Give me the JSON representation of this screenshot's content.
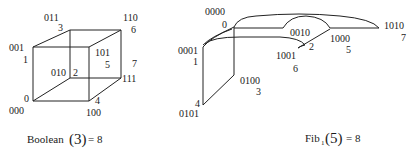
{
  "boolean_cube": {
    "vertices": [
      {
        "bits": "000",
        "index": "0"
      },
      {
        "bits": "001",
        "index": "1"
      },
      {
        "bits": "010",
        "index": "2"
      },
      {
        "bits": "011",
        "index": "3"
      },
      {
        "bits": "100",
        "index": "4"
      },
      {
        "bits": "101",
        "index": "5"
      },
      {
        "bits": "110",
        "index": "6"
      },
      {
        "bits": "111",
        "index": "7"
      }
    ],
    "caption": {
      "name": "Boolean",
      "arg": "(3)",
      "equals": "= 8"
    }
  },
  "fibonacci_cube": {
    "vertices": [
      {
        "bits": "0000",
        "index": "0"
      },
      {
        "bits": "0001",
        "index": "1"
      },
      {
        "bits": "0010",
        "index": "2"
      },
      {
        "bits": "0100",
        "index": "3"
      },
      {
        "bits": "0101",
        "index": "4"
      },
      {
        "bits": "1000",
        "index": "5"
      },
      {
        "bits": "1001",
        "index": "6"
      },
      {
        "bits": "1010",
        "index": "7"
      }
    ],
    "caption": {
      "name": "Fib",
      "subscript": "1",
      "arg": "(5)",
      "equals": "= 8"
    }
  }
}
